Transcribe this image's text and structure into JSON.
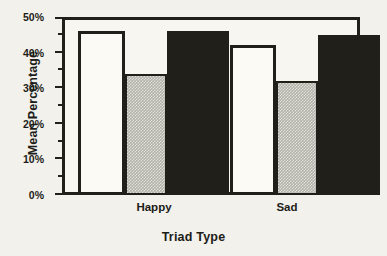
{
  "chart_data": {
    "type": "bar",
    "title": "",
    "xlabel": "Triad Type",
    "ylabel": "Mean Percentage",
    "categories": [
      "Happy",
      "Sad"
    ],
    "series": [
      {
        "name": "white-bar",
        "fill": "white",
        "values": [
          46,
          42
        ]
      },
      {
        "name": "gray-bar",
        "fill": "gray",
        "values": [
          34,
          32
        ]
      },
      {
        "name": "black-bar",
        "fill": "black",
        "values": [
          46,
          45
        ]
      }
    ],
    "ylim": [
      0,
      50
    ],
    "ytick_values": [
      0,
      10,
      20,
      30,
      40,
      50
    ],
    "ytick_labels": [
      "0%",
      "10%",
      "20%",
      "30%",
      "40%",
      "50%"
    ],
    "yminor_values": [
      5,
      15,
      25,
      35,
      45
    ],
    "grid": false,
    "legend": "none"
  },
  "axes": {
    "ylabel_text": "Mean Percentage",
    "xlabel_text": "Triad Type",
    "tick_0": "0%",
    "tick_1": "10%",
    "tick_2": "20%",
    "tick_3": "30%",
    "tick_4": "40%",
    "tick_5": "50%",
    "cat_0": "Happy",
    "cat_1": "Sad"
  },
  "colors": {
    "background": "#f2f1ec",
    "plot_background": "#f7f6f1",
    "ink": "#211f19",
    "bar_white": "#fbfaf5",
    "bar_gray": "#b3b2a9",
    "bar_black": "#211f19"
  }
}
